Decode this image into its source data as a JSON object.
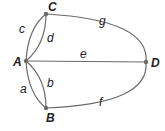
{
  "diagram": {
    "type": "multigraph",
    "vertices": [
      {
        "id": "A",
        "label": "A"
      },
      {
        "id": "B",
        "label": "B"
      },
      {
        "id": "C",
        "label": "C"
      },
      {
        "id": "D",
        "label": "D"
      }
    ],
    "edges": [
      {
        "id": "a",
        "label": "a",
        "from": "A",
        "to": "B"
      },
      {
        "id": "b",
        "label": "b",
        "from": "A",
        "to": "B"
      },
      {
        "id": "c",
        "label": "c",
        "from": "A",
        "to": "C"
      },
      {
        "id": "d",
        "label": "d",
        "from": "A",
        "to": "C"
      },
      {
        "id": "e",
        "label": "e",
        "from": "A",
        "to": "D"
      },
      {
        "id": "f",
        "label": "f",
        "from": "B",
        "to": "D"
      },
      {
        "id": "g",
        "label": "g",
        "from": "C",
        "to": "D"
      }
    ],
    "colors": {
      "edge": "#6b6b6b",
      "text": "#222222",
      "background": "#ffffff"
    }
  }
}
